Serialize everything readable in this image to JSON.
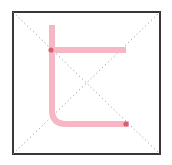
{
  "figure": {
    "title": "",
    "canvas": {
      "width": 172,
      "height": 165,
      "background": "#ffffff"
    }
  },
  "frame": {
    "name": "square-border",
    "x": 13,
    "y": 12,
    "width": 147,
    "height": 142,
    "stroke_color": "#3b3438",
    "stroke_width": 2,
    "fill": "#ffffff"
  },
  "guides": {
    "style": "dotted",
    "stroke_color": "#8a8a8a",
    "stroke_width": 1,
    "dash": "1 3",
    "lines": [
      {
        "name": "diagonal-down-right",
        "x1": 13,
        "y1": 12,
        "x2": 160,
        "y2": 154
      },
      {
        "name": "diagonal-up-right",
        "x1": 13,
        "y1": 154,
        "x2": 160,
        "y2": 12
      }
    ]
  },
  "path": {
    "name": "pink-folded-path",
    "stroke_color": "#f7b6c3",
    "stroke_width": 6,
    "corner_radius": 14,
    "linecap": "butt",
    "segments": [
      {
        "name": "vertical-stem",
        "x1": 52,
        "y1": 25,
        "x2": 52,
        "y2": 110
      },
      {
        "name": "top-horizontal-arm",
        "x1": 52,
        "y1": 50,
        "x2": 126,
        "y2": 50
      },
      {
        "name": "bottom-horizontal-arm",
        "x1": 66,
        "y1": 124,
        "x2": 129,
        "y2": 124
      }
    ],
    "d": "M 52 25 L 52 110 Q 52 124 66 124 L 129 124"
  },
  "markers": [
    {
      "name": "marker-top-left",
      "cx": 51,
      "cy": 50,
      "radius": 2.6,
      "color": "#d4505f"
    },
    {
      "name": "marker-bottom-right",
      "cx": 126,
      "cy": 124,
      "radius": 2.6,
      "color": "#d4505f"
    }
  ],
  "labels": {
    "caption": "",
    "annotation": ""
  }
}
